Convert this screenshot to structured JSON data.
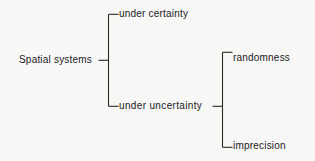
{
  "diagram": {
    "type": "bracket-tree",
    "background_color": "#f7f7f5",
    "line_color": "#2b2927",
    "text_color": "#23211f",
    "nodes": {
      "root": "Spatial systems",
      "certainty": "under certainty",
      "uncertainty": "under uncertainty",
      "randomness": "randomness",
      "imprecision": "imprecision"
    },
    "edges": [
      {
        "from": "Spatial systems",
        "to": "under certainty"
      },
      {
        "from": "Spatial systems",
        "to": "under uncertainty"
      },
      {
        "from": "under uncertainty",
        "to": "randomness"
      },
      {
        "from": "under uncertainty",
        "to": "imprecision"
      }
    ]
  }
}
